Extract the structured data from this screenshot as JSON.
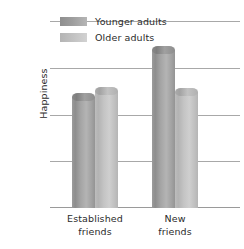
{
  "chart_data": {
    "type": "bar",
    "title": "",
    "xlabel": "",
    "ylabel": "Happiness",
    "ylim": [
      0,
      4
    ],
    "yticks": [
      "0",
      "1",
      "2",
      "3",
      "4"
    ],
    "grid": true,
    "legend_position": "top-left",
    "categories": [
      "Established friends",
      "New friends"
    ],
    "category_lines": [
      [
        "Established",
        "friends"
      ],
      [
        "New",
        "friends"
      ]
    ],
    "series": [
      {
        "name": "Younger adults",
        "color": "#9a9a9a",
        "values": [
          2.48,
          3.49
        ]
      },
      {
        "name": "Older adults",
        "color": "#c3c3c3",
        "values": [
          2.61,
          2.59
        ]
      }
    ]
  },
  "axis": {
    "y_title": "Happiness",
    "y_tick_4": "4",
    "y_tick_3": "3",
    "y_tick_2": "2",
    "y_tick_1": "1",
    "y_tick_0": "0",
    "x_cat1_line1": "Established",
    "x_cat1_line2": "friends",
    "x_cat2_line1": "New",
    "x_cat2_line2": "friends"
  },
  "legend": {
    "item1": "Younger adults",
    "item2": "Older adults"
  }
}
